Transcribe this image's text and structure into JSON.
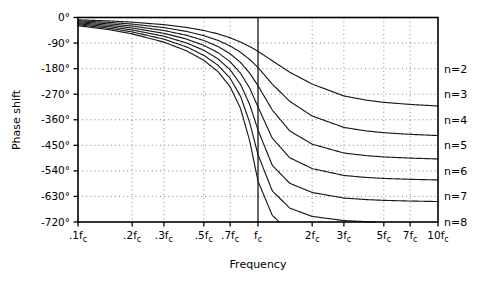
{
  "chart_data": {
    "type": "line",
    "title": "",
    "xlabel": "Frequency",
    "ylabel": "Phase shift",
    "xscale": "log",
    "xlim": [
      0.1,
      10
    ],
    "ylim": [
      -720,
      0
    ],
    "grid": true,
    "legend_position": "right-of-axes",
    "x_tick_labels": [
      ".1f",
      ".2f",
      ".3f",
      ".5f",
      ".7f",
      "f",
      "2f",
      "3f",
      "5f",
      "7f",
      "10f"
    ],
    "x_tick_subscripts": [
      "c",
      "c",
      "c",
      "c",
      "c",
      "c",
      "c",
      "c",
      "c",
      "c",
      "c"
    ],
    "x_tick_values": [
      0.1,
      0.2,
      0.3,
      0.5,
      0.7,
      1.0,
      2.0,
      3.0,
      5.0,
      7.0,
      10.0
    ],
    "y_tick_labels": [
      "0°",
      "-90°",
      "-180°",
      "-270°",
      "-360°",
      "-450°",
      "-540°",
      "-630°",
      "-720°"
    ],
    "y_tick_values": [
      0,
      -90,
      -180,
      -270,
      -360,
      -450,
      -540,
      -630,
      -720
    ],
    "annotations": [
      {
        "text": "f",
        "sub": "c",
        "note": "solid vertical reference line at cutoff frequency"
      }
    ],
    "series": [
      {
        "name": "n=2",
        "order": 2,
        "label": "n=2",
        "phase_at_fc": -90,
        "phase_asymptote": -180,
        "x": [
          0.1,
          0.15,
          0.2,
          0.3,
          0.4,
          0.5,
          0.6,
          0.7,
          0.8,
          0.9,
          1.0,
          1.2,
          1.5,
          2.0,
          3.0,
          4.0,
          5.0,
          7.0,
          10.0
        ],
        "values": [
          -8.1,
          -12.2,
          -16.4,
          -25.2,
          -34.8,
          -45.6,
          -57.8,
          -71.4,
          -86.4,
          -102.4,
          -119.1,
          -152.3,
          -192.5,
          -234.6,
          -276.1,
          -291.1,
          -298.7,
          -306.1,
          -311.6
        ]
      },
      {
        "name": "n=3",
        "order": 3,
        "label": "n=3",
        "phase_at_fc": -135,
        "phase_asymptote": -270,
        "x": [
          0.1,
          0.15,
          0.2,
          0.3,
          0.4,
          0.5,
          0.6,
          0.7,
          0.8,
          0.9,
          1.0,
          1.2,
          1.5,
          2.0,
          3.0,
          4.0,
          5.0,
          7.0,
          10.0
        ],
        "values": [
          -11.5,
          -17.3,
          -23.2,
          -35.5,
          -48.9,
          -63.8,
          -80.7,
          -100.1,
          -122.5,
          -148.0,
          -176.0,
          -234.4,
          -295.1,
          -346.8,
          -387.0,
          -399.5,
          -405.6,
          -411.4,
          -415.7
        ]
      },
      {
        "name": "n=4",
        "order": 4,
        "label": "n=4",
        "phase_at_fc": -180,
        "phase_asymptote": -360,
        "x": [
          0.1,
          0.15,
          0.2,
          0.3,
          0.4,
          0.5,
          0.6,
          0.7,
          0.8,
          0.9,
          1.0,
          1.2,
          1.5,
          2.0,
          3.0,
          4.0,
          5.0,
          7.0,
          10.0
        ],
        "values": [
          -15.0,
          -22.5,
          -30.1,
          -45.7,
          -62.4,
          -80.9,
          -102.2,
          -127.5,
          -158.4,
          -196.2,
          -240.0,
          -325.5,
          -399.3,
          -446.0,
          -477.2,
          -486.4,
          -490.9,
          -495.0,
          -498.1
        ]
      },
      {
        "name": "n=5",
        "order": 5,
        "label": "n=5",
        "phase_at_fc": -225,
        "phase_asymptote": -450,
        "x": [
          0.1,
          0.15,
          0.2,
          0.3,
          0.4,
          0.5,
          0.6,
          0.7,
          0.8,
          0.9,
          1.0,
          1.2,
          1.5,
          2.0,
          3.0,
          4.0,
          5.0,
          7.0,
          10.0
        ],
        "values": [
          -18.4,
          -27.6,
          -36.9,
          -55.8,
          -75.8,
          -98.0,
          -123.9,
          -155.6,
          -196.3,
          -249.1,
          -315.0,
          -424.8,
          -493.8,
          -531.9,
          -556.2,
          -563.2,
          -566.6,
          -569.7,
          -572.0
        ]
      },
      {
        "name": "n=6",
        "order": 6,
        "label": "n=6",
        "phase_at_fc": -270,
        "phase_asymptote": -540,
        "x": [
          0.1,
          0.15,
          0.2,
          0.3,
          0.4,
          0.5,
          0.6,
          0.7,
          0.8,
          0.9,
          1.0,
          1.2,
          1.5,
          2.0,
          3.0,
          4.0,
          5.0,
          7.0,
          10.0
        ],
        "values": [
          -21.9,
          -32.8,
          -43.8,
          -66.0,
          -89.4,
          -115.3,
          -145.8,
          -184.1,
          -235.6,
          -307.1,
          -396.0,
          -520.4,
          -583.6,
          -616.1,
          -635.6,
          -641.1,
          -643.8,
          -646.2,
          -648.0
        ]
      },
      {
        "name": "n=7",
        "order": 7,
        "label": "n=7",
        "phase_at_fc": -315,
        "phase_asymptote": -630,
        "x": [
          0.1,
          0.15,
          0.2,
          0.3,
          0.4,
          0.5,
          0.6,
          0.7,
          0.8,
          0.9,
          1.0,
          1.2,
          1.5,
          2.0,
          3.0,
          4.0,
          5.0,
          7.0,
          10.0
        ],
        "values": [
          -25.3,
          -38.0,
          -50.7,
          -76.3,
          -103.2,
          -133.0,
          -168.3,
          -213.6,
          -277.5,
          -370.5,
          -483.0,
          -610.2,
          -671.1,
          -700.3,
          -715.0,
          -719.0,
          -721.0,
          -722.8,
          -724.1
        ]
      },
      {
        "name": "n=8",
        "order": 8,
        "label": "n=8",
        "phase_at_fc": -360,
        "phase_asymptote": -720,
        "x": [
          0.1,
          0.15,
          0.2,
          0.3,
          0.4,
          0.5,
          0.6,
          0.7,
          0.8,
          0.9,
          1.0,
          1.2,
          1.5,
          2.0,
          3.0,
          4.0,
          5.0,
          7.0,
          10.0
        ],
        "values": [
          -28.8,
          -43.2,
          -57.6,
          -86.6,
          -117.0,
          -150.7,
          -190.9,
          -243.7,
          -320.4,
          -435.3,
          -576.0,
          -696.6,
          -754.8,
          -780.2,
          -792.6,
          -796.0,
          -797.6,
          -799.1,
          -800.1
        ]
      }
    ]
  },
  "axes": {
    "x_title": "Frequency",
    "y_title": "Phase shift"
  }
}
